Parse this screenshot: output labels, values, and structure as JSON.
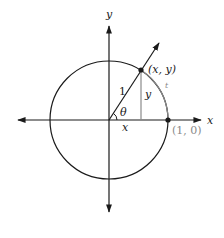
{
  "diagram": {
    "type": "unit-circle",
    "colors": {
      "ink": "#1a1a1a",
      "accent_gray": "#8a8a8a",
      "background": "#ffffff"
    },
    "axes": {
      "x_label": "x",
      "y_label": "y"
    },
    "labels": {
      "point_xy": "(x, y)",
      "point_10": "(1, 0)",
      "radius": "1",
      "angle": "θ",
      "horizontal_leg": "x",
      "vertical_leg": "y",
      "arc": "t"
    }
  }
}
